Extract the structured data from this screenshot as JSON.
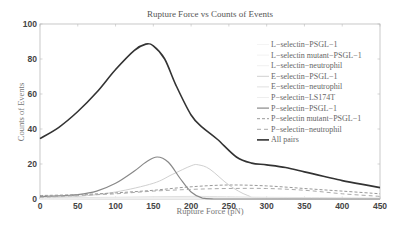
{
  "chart_data": {
    "type": "line",
    "title": "Rupture Force vs Counts of Events",
    "xlabel": "Rupture Force (pN)",
    "ylabel": "Counts of Events",
    "xlim": [
      0,
      450
    ],
    "ylim": [
      0,
      100
    ],
    "xticks": [
      0,
      50,
      100,
      150,
      200,
      250,
      300,
      350,
      400,
      450
    ],
    "yticks": [
      0,
      20,
      40,
      60,
      80,
      100
    ],
    "grid": false,
    "legend_position": "upper right",
    "series": [
      {
        "name": "L−selectin−PSGL−1",
        "color": "#f4f4f4",
        "dash": "",
        "width": 1,
        "x": [
          0,
          100,
          200,
          300,
          450
        ],
        "y": [
          0,
          0.5,
          0.5,
          0.3,
          0
        ]
      },
      {
        "name": "L−selectin mutant−PSGL−1",
        "color": "#f2f2f2",
        "dash": "",
        "width": 1,
        "x": [
          0,
          100,
          200,
          300,
          450
        ],
        "y": [
          0,
          0.3,
          0.4,
          0.3,
          0
        ]
      },
      {
        "name": "L−selectin−neutrophil",
        "color": "#f0f0f0",
        "dash": "",
        "width": 1,
        "x": [
          0,
          100,
          200,
          300,
          450
        ],
        "y": [
          0,
          0.4,
          0.6,
          0.4,
          0
        ]
      },
      {
        "name": "E−selectin−PSGL−1",
        "color": "#d0d0d0",
        "dash": "",
        "width": 1,
        "x": [
          0,
          50,
          100,
          150,
          175,
          200,
          210,
          225,
          250,
          275,
          300,
          450
        ],
        "y": [
          0.5,
          1.5,
          4,
          9,
          14,
          19,
          19.5,
          17,
          8,
          2,
          0.5,
          0
        ]
      },
      {
        "name": "E−selectin−neutrophil",
        "color": "#e0e0e0",
        "dash": "",
        "width": 1,
        "x": [
          0,
          100,
          200,
          300,
          450
        ],
        "y": [
          0.5,
          1,
          1.5,
          1,
          0.5
        ]
      },
      {
        "name": "P−selectin−LS174T",
        "color": "#eeeeee",
        "dash": "",
        "width": 1,
        "x": [
          0,
          100,
          200,
          300,
          450
        ],
        "y": [
          0.3,
          0.6,
          0.8,
          0.5,
          0.2
        ]
      },
      {
        "name": "P−selectin−PSGL−1",
        "color": "#888888",
        "dash": "",
        "width": 1.2,
        "x": [
          0,
          25,
          50,
          75,
          100,
          125,
          140,
          155,
          170,
          185,
          200,
          215,
          230,
          250,
          450
        ],
        "y": [
          1.5,
          1.8,
          2.5,
          4.5,
          9,
          16,
          21,
          24,
          21,
          12,
          4,
          0.5,
          0,
          0,
          0
        ]
      },
      {
        "name": "P−selectin mutant−PSGL−1",
        "color": "#999999",
        "dash": "3,2",
        "width": 1,
        "x": [
          0,
          50,
          100,
          150,
          200,
          250,
          300,
          350,
          400,
          450
        ],
        "y": [
          2,
          2.5,
          3.5,
          5,
          7,
          8,
          7.5,
          6,
          4.5,
          3
        ]
      },
      {
        "name": "P−selectin−neutrophil",
        "color": "#aaaaaa",
        "dash": "4,3",
        "width": 1,
        "x": [
          0,
          50,
          100,
          150,
          200,
          250,
          300,
          350,
          400,
          450
        ],
        "y": [
          1,
          2,
          3,
          4.5,
          5.5,
          6,
          6,
          5,
          3,
          1.5
        ]
      },
      {
        "name": "All pairs",
        "color": "#333333",
        "dash": "",
        "width": 1.6,
        "x": [
          0,
          25,
          50,
          75,
          100,
          125,
          140,
          150,
          165,
          180,
          200,
          215,
          235,
          260,
          280,
          300,
          325,
          350,
          375,
          400,
          425,
          450
        ],
        "y": [
          34.5,
          41,
          50,
          61,
          74,
          85,
          88.5,
          87.5,
          80,
          65,
          48,
          41,
          34,
          24,
          20.5,
          19.5,
          18,
          15.5,
          13,
          10.5,
          8.5,
          6.5
        ]
      }
    ]
  }
}
